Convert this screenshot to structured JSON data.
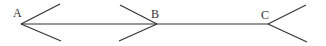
{
  "diagram": {
    "line_color": "#333333",
    "points": [
      {
        "label": "A",
        "x": 21,
        "y": 24,
        "label_x": 13,
        "label_y": 17,
        "arms": [
          [
            60,
            4
          ],
          [
            61,
            41
          ]
        ]
      },
      {
        "label": "B",
        "x": 157,
        "y": 24,
        "label_x": 151,
        "label_y": 18,
        "arms": [
          [
            120,
            5
          ],
          [
            119,
            41
          ]
        ]
      },
      {
        "label": "C",
        "x": 268,
        "y": 24,
        "label_x": 261,
        "label_y": 19,
        "arms": [
          [
            306,
            5
          ],
          [
            307,
            42
          ]
        ]
      }
    ],
    "segment": {
      "from": "A",
      "to": "C"
    }
  }
}
